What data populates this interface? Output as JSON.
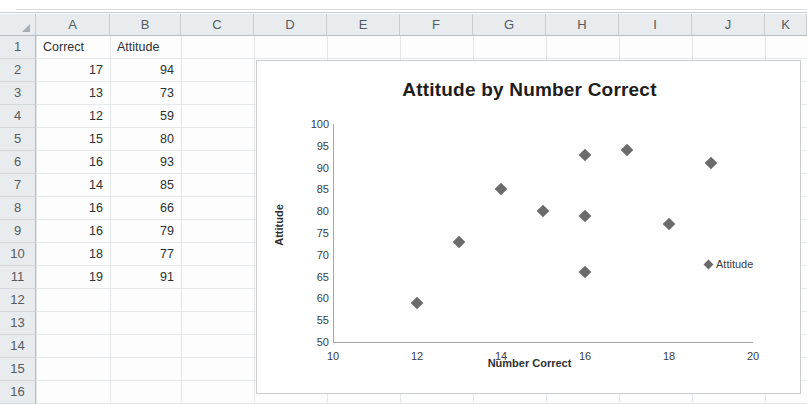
{
  "spreadsheet": {
    "column_headers": [
      "A",
      "B",
      "C",
      "D",
      "E",
      "F",
      "G",
      "H",
      "I",
      "J",
      "K"
    ],
    "row_numbers": [
      "1",
      "2",
      "3",
      "4",
      "5",
      "6",
      "7",
      "8",
      "9",
      "10",
      "11",
      "12",
      "13",
      "14",
      "15",
      "16"
    ],
    "header_row": {
      "a": "Correct",
      "b": "Attitude"
    },
    "rows": [
      {
        "row": "2",
        "correct": "17",
        "attitude": "94"
      },
      {
        "row": "3",
        "correct": "13",
        "attitude": "73"
      },
      {
        "row": "4",
        "correct": "12",
        "attitude": "59"
      },
      {
        "row": "5",
        "correct": "15",
        "attitude": "80"
      },
      {
        "row": "6",
        "correct": "16",
        "attitude": "93"
      },
      {
        "row": "7",
        "correct": "14",
        "attitude": "85"
      },
      {
        "row": "8",
        "correct": "16",
        "attitude": "66"
      },
      {
        "row": "9",
        "correct": "16",
        "attitude": "79"
      },
      {
        "row": "10",
        "correct": "18",
        "attitude": "77"
      },
      {
        "row": "11",
        "correct": "19",
        "attitude": "91"
      }
    ],
    "select-all-icon": "select-all-triangle"
  },
  "chart_data": {
    "type": "scatter",
    "title": "Attitude by Number Correct",
    "xlabel": "Number Correct",
    "ylabel": "Attitude",
    "xlim": [
      10,
      20
    ],
    "ylim": [
      50,
      100
    ],
    "xticks": [
      "10",
      "12",
      "14",
      "16",
      "18",
      "20"
    ],
    "yticks": [
      "100",
      "95",
      "90",
      "85",
      "80",
      "75",
      "70",
      "65",
      "60",
      "55",
      "50"
    ],
    "grid": false,
    "legend_position": "right",
    "series": [
      {
        "name": "Attitude",
        "marker": "diamond",
        "color": "#6b6b6b",
        "points": [
          {
            "x": 17,
            "y": 94
          },
          {
            "x": 13,
            "y": 73
          },
          {
            "x": 12,
            "y": 59
          },
          {
            "x": 15,
            "y": 80
          },
          {
            "x": 16,
            "y": 93
          },
          {
            "x": 14,
            "y": 85
          },
          {
            "x": 16,
            "y": 66
          },
          {
            "x": 16,
            "y": 79
          },
          {
            "x": 18,
            "y": 77
          },
          {
            "x": 19,
            "y": 91
          }
        ]
      }
    ]
  }
}
